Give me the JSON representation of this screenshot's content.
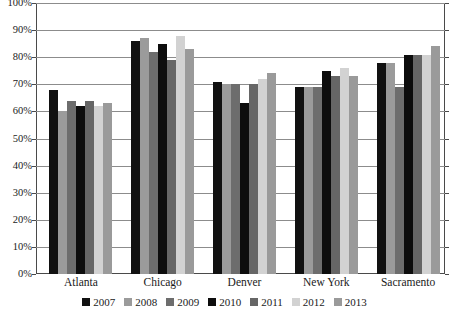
{
  "chart_data": {
    "type": "bar",
    "title": "",
    "subtitle": "",
    "xlabel": "",
    "ylabel": "",
    "categories": [
      "Atlanta",
      "Chicago",
      "Denver",
      "New York",
      "Sacramento"
    ],
    "series": [
      {
        "name": "2007",
        "color": "#111111",
        "values": [
          68,
          86,
          71,
          69,
          78
        ]
      },
      {
        "name": "2008",
        "color": "#9b9b9b",
        "values": [
          60,
          87,
          70,
          69,
          78
        ]
      },
      {
        "name": "2009",
        "color": "#6d6d6d",
        "values": [
          64,
          82,
          70,
          69,
          69
        ]
      },
      {
        "name": "2010",
        "color": "#0d0d0d",
        "values": [
          62,
          85,
          63,
          75,
          81
        ]
      },
      {
        "name": "2011",
        "color": "#666666",
        "values": [
          64,
          79,
          70,
          73,
          81
        ]
      },
      {
        "name": "2012",
        "color": "#d2d2d2",
        "values": [
          62,
          88,
          72,
          76,
          81
        ]
      },
      {
        "name": "2013",
        "color": "#9a9a9a",
        "values": [
          63,
          83,
          74,
          73,
          84
        ]
      }
    ],
    "ylim": [
      0,
      100
    ],
    "ytick_labels": [
      "100%",
      "90%",
      "80%",
      "70%",
      "60%",
      "50%",
      "40%",
      "30%",
      "20%",
      "10%",
      "0%"
    ],
    "ytick_values": [
      100,
      90,
      80,
      70,
      60,
      50,
      40,
      30,
      20,
      10,
      0
    ],
    "grid": true,
    "grid_axis": "y",
    "legend_position": "bottom",
    "legend_entries": [
      "2007",
      "2008",
      "2009",
      "2010",
      "2011",
      "2012",
      "2013"
    ]
  }
}
